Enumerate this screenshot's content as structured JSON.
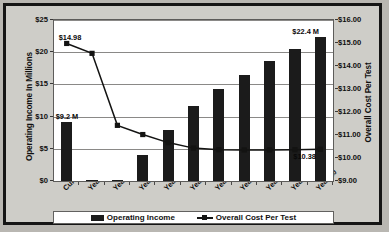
{
  "chart_data": {
    "type": "bar",
    "title": "",
    "subtitle": "",
    "categories": [
      "Current",
      "Year 1",
      "Year 2",
      "Year 3",
      "Year 4",
      "Year 5",
      "Year 6",
      "Year 7",
      "Year 8",
      "Year 9",
      "Year 10"
    ],
    "series": [
      {
        "name": "Operating Income",
        "type": "bar",
        "axis": "left",
        "values": [
          9.2,
          0.2,
          0.05,
          4.0,
          7.9,
          11.6,
          14.3,
          16.5,
          18.6,
          20.5,
          22.4
        ]
      },
      {
        "name": "Overall Cost Per Test",
        "type": "line",
        "axis": "right",
        "values": [
          14.98,
          14.55,
          11.42,
          11.02,
          10.67,
          10.43,
          10.36,
          10.35,
          10.35,
          10.36,
          10.38
        ]
      }
    ],
    "xlabel": "",
    "ylabel": "Operating Income In Millions",
    "ylabel_right": "Overall Cost Per Test",
    "ylim": [
      0,
      25
    ],
    "ylim_right": [
      9.0,
      16.0
    ],
    "yticks": [
      "$0",
      "$5",
      "$10",
      "$15",
      "$20",
      "$25"
    ],
    "yticks_right": [
      "$9.00",
      "$10.00",
      "$11.00",
      "$12.00",
      "$13.00",
      "$14.00",
      "$15.00",
      "$16.00"
    ],
    "grid": true,
    "legend_position": "bottom",
    "annotations": [
      {
        "name": "current-income-label",
        "text": "$9.2 M",
        "category": "Current",
        "series": "Operating Income"
      },
      {
        "name": "year10-income-label",
        "text": "$22.4 M",
        "category": "Year 10",
        "series": "Operating Income"
      },
      {
        "name": "current-cost-label",
        "text": "$14.98",
        "category": "Current",
        "series": "Overall Cost Per Test"
      },
      {
        "name": "year10-cost-label",
        "text": "$10.38",
        "category": "Year 10",
        "series": "Overall Cost Per Test"
      }
    ],
    "colors": {
      "bar": "#1b1b1b",
      "line": "#131312",
      "plot_background": "#ffffff",
      "chart_background": "#cecdc8",
      "gridline": "#8a8987",
      "border": "#151515"
    }
  },
  "legend": {
    "items": [
      {
        "label": "Operating Income",
        "marker": "bar-swatch"
      },
      {
        "label": "Overall Cost Per Test",
        "marker": "line-square-marker"
      }
    ]
  }
}
